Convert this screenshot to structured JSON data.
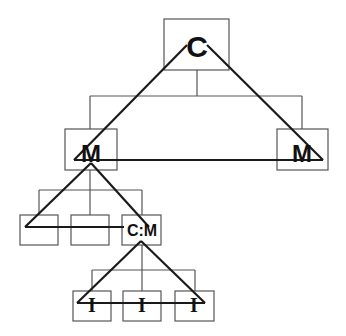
{
  "diagram": {
    "type": "hierarchical tree with overlaid triangles",
    "root": {
      "label": "C"
    },
    "level1": [
      {
        "label": "M"
      },
      {
        "label": "M"
      }
    ],
    "level2": [
      {
        "label": ""
      },
      {
        "label": ""
      },
      {
        "label": "C:M"
      }
    ],
    "level3": [
      {
        "label": "I"
      },
      {
        "label": "I"
      },
      {
        "label": "I"
      }
    ],
    "colors": {
      "box_stroke": "#555555",
      "triangle_stroke": "#1a1a1a",
      "text": "#111111",
      "background": "#ffffff"
    }
  }
}
